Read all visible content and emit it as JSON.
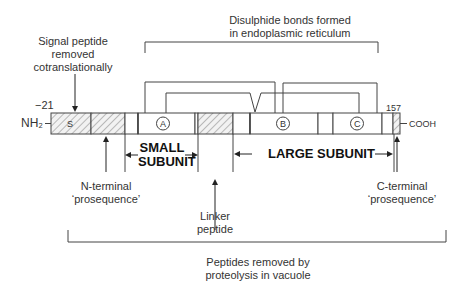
{
  "diagram": {
    "labels": {
      "signal_peptide": [
        "Signal peptide",
        "removed",
        "cotranslationally"
      ],
      "disulphide": [
        "Disulphide bonds formed",
        "in endoplasmic reticulum"
      ],
      "n_start": "−21",
      "c_end": "157",
      "nh2": "NH₂",
      "cooh": "COOH",
      "segment_s": "S",
      "domain_a": "A",
      "domain_b": "B",
      "domain_c": "C",
      "small_subunit": [
        "SMALL",
        "SUBUNIT"
      ],
      "large_subunit": "LARGE SUBUNIT",
      "n_terminal": [
        "N-terminal",
        "‘prosequence’"
      ],
      "linker": [
        "Linker",
        "peptide"
      ],
      "c_terminal": [
        "C-terminal",
        "‘prosequence’"
      ],
      "vacuole": [
        "Peptides removed by",
        "proteolysis in vacuole"
      ]
    },
    "colors": {
      "line": "#333333",
      "hatch": "#8a8a8a",
      "background": "#ffffff"
    }
  }
}
